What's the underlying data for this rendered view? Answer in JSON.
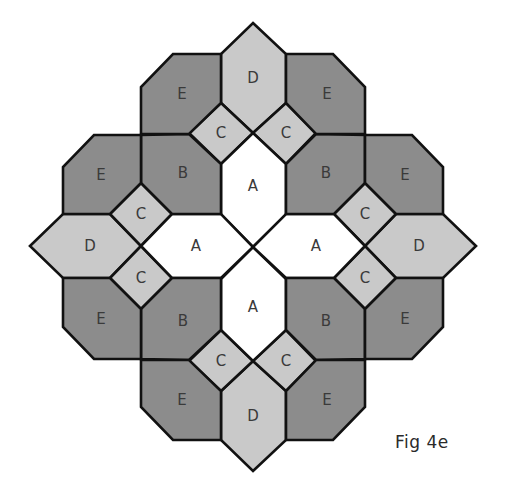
{
  "figure": {
    "caption": "Fig 4e",
    "colors": {
      "A": "#ffffff",
      "B": "#8c8c8c",
      "C": "#c9c9c9",
      "D": "#c9c9c9",
      "E": "#8c8c8c",
      "outline": "#111111"
    },
    "pieces": [
      {
        "label": "D",
        "points": "253,23 286,54 286,103 253,133 221,103 221,54",
        "lx": 253,
        "ly": 78
      },
      {
        "label": "D",
        "points": "253,471 286,440 286,391 253,361 221,391 221,440",
        "lx": 253,
        "ly": 416
      },
      {
        "label": "D",
        "points": "30,246 63,214 110,214 141,246 110,278 63,278",
        "lx": 90,
        "ly": 246
      },
      {
        "label": "D",
        "points": "476,246 443,214 396,214 365,246 396,278 443,278",
        "lx": 419,
        "ly": 246
      },
      {
        "label": "C",
        "points": "221,103 253,133 221,164 189,133",
        "lx": 221,
        "ly": 133
      },
      {
        "label": "C",
        "points": "286,103 316,133 286,164 253,133",
        "lx": 286,
        "ly": 133
      },
      {
        "label": "C",
        "points": "221,391 253,361 221,330 189,361",
        "lx": 221,
        "ly": 361
      },
      {
        "label": "C",
        "points": "286,391 316,361 286,330 253,361",
        "lx": 286,
        "ly": 361
      },
      {
        "label": "C",
        "points": "110,214 141,183 172,214 141,246",
        "lx": 141,
        "ly": 214
      },
      {
        "label": "C",
        "points": "141,246 172,278 141,309 110,278",
        "lx": 141,
        "ly": 278
      },
      {
        "label": "C",
        "points": "396,214 365,183 334,214 365,246",
        "lx": 365,
        "ly": 214
      },
      {
        "label": "C",
        "points": "365,246 334,278 365,309 396,278",
        "lx": 365,
        "ly": 278
      },
      {
        "label": "A",
        "points": "221,164 253,133 286,164 286,215 253,247 221,215",
        "lx": 253,
        "ly": 186
      },
      {
        "label": "A",
        "points": "221,330 253,361 286,330 286,279 253,247 221,279",
        "lx": 253,
        "ly": 307
      },
      {
        "label": "A",
        "points": "141,246 172,214 221,214 253,247 221,278 172,278",
        "lx": 196,
        "ly": 246
      },
      {
        "label": "A",
        "points": "365,246 334,214 286,214 253,247 286,278 334,278",
        "lx": 316,
        "ly": 246
      },
      {
        "label": "B",
        "points": "141,135 189,134 221,164 221,214 172,214 141,183",
        "lx": 183,
        "ly": 173
      },
      {
        "label": "B",
        "points": "365,135 316,134 286,164 286,214 334,214 365,183",
        "lx": 326,
        "ly": 173
      },
      {
        "label": "B",
        "points": "141,359 189,360 221,330 221,278 172,278 141,309",
        "lx": 183,
        "ly": 321
      },
      {
        "label": "B",
        "points": "365,359 316,360 286,330 286,278 334,278 365,309",
        "lx": 326,
        "ly": 321
      },
      {
        "label": "E",
        "points": "173,54 221,54 221,103 189,134 141,134 141,87",
        "lx": 182,
        "ly": 94
      },
      {
        "label": "E",
        "points": "333,54 286,54 286,103 316,134 365,134 365,87",
        "lx": 327,
        "ly": 94
      },
      {
        "label": "E",
        "points": "173,440 221,440 221,391 189,360 141,360 141,407",
        "lx": 182,
        "ly": 400
      },
      {
        "label": "E",
        "points": "333,440 286,440 286,391 316,360 365,360 365,407",
        "lx": 327,
        "ly": 400
      },
      {
        "label": "E",
        "points": "94,135 141,135 141,183 110,214 63,214 63,167",
        "lx": 101,
        "ly": 175
      },
      {
        "label": "E",
        "points": "412,135 365,135 365,183 396,214 443,214 443,167",
        "lx": 405,
        "ly": 175
      },
      {
        "label": "E",
        "points": "94,359 141,359 141,309 110,278 63,278 63,327",
        "lx": 101,
        "ly": 319
      },
      {
        "label": "E",
        "points": "412,359 365,359 365,309 396,278 443,278 443,327",
        "lx": 405,
        "ly": 319
      }
    ]
  }
}
